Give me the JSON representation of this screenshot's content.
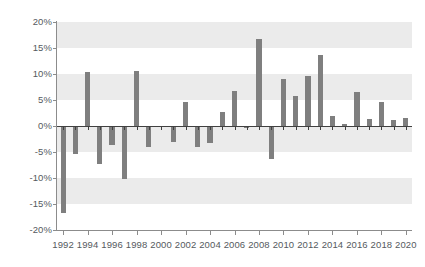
{
  "chart_data": {
    "type": "bar",
    "title": "",
    "subtitle": "",
    "xlabel": "",
    "ylabel": "",
    "ylim": [
      -20,
      20
    ],
    "ytick_labels": [
      "20%",
      "15%",
      "10%",
      "5%",
      "0%",
      "-5%",
      "-10%",
      "-15%",
      "-20%"
    ],
    "ytick_values": [
      20,
      15,
      10,
      5,
      0,
      -5,
      -10,
      -15,
      -20
    ],
    "xtick_labels": [
      "1992",
      "1994",
      "1996",
      "1998",
      "2000",
      "2002",
      "2004",
      "2006",
      "2008",
      "2010",
      "2012",
      "2014",
      "2016",
      "2018",
      "2020"
    ],
    "xtick_values": [
      1992,
      1994,
      1996,
      1998,
      2000,
      2002,
      2004,
      2006,
      2008,
      2010,
      2012,
      2014,
      2016,
      2018,
      2020
    ],
    "grid": "horizontal-alternating-bands",
    "legend": "none",
    "bar_color": "#7f7f7f",
    "band_color": "#ebebeb",
    "axis_color": "#8c8c8c",
    "tick_label_color": "#555a5e",
    "categories": [
      1992,
      1993,
      1994,
      1995,
      1996,
      1997,
      1998,
      1999,
      2000,
      2001,
      2002,
      2003,
      2004,
      2005,
      2006,
      2007,
      2008,
      2009,
      2010,
      2011,
      2012,
      2013,
      2014,
      2015,
      2016,
      2017,
      2018,
      2019,
      2020
    ],
    "values": [
      -16.8,
      -5.4,
      10.4,
      -7.3,
      -3.6,
      -10.1,
      10.5,
      -4.1,
      -0.2,
      -3.0,
      4.6,
      -4.0,
      -3.3,
      2.6,
      6.7,
      -0.3,
      16.8,
      -6.4,
      9.1,
      5.8,
      9.7,
      13.6,
      2.0,
      0.4,
      6.6,
      1.4,
      4.7,
      1.1,
      1.5
    ]
  }
}
